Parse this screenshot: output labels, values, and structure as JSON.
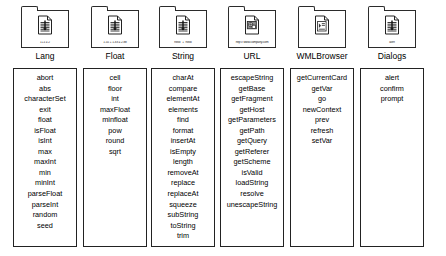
{
  "diagram": {
    "columns": [
      {
        "title": "Lang",
        "icon_name": "folder-icon",
        "glyph_name": "document-icon",
        "glyph_caption": "1+1 = 2",
        "methods": [
          "abort",
          "abs",
          "characterSet",
          "exit",
          "float",
          "isFloat",
          "isInt",
          "max",
          "maxInt",
          "min",
          "minInt",
          "parseFloat",
          "parseInt",
          "random",
          "seed"
        ]
      },
      {
        "title": "Float",
        "icon_name": "folder-icon",
        "glyph_name": "document-icon",
        "glyph_caption": "1.55 + 1.33 = 2.88",
        "methods": [
          "cell",
          "floor",
          "int",
          "maxFloat",
          "minfloat",
          "pow",
          "round",
          "sqrt"
        ]
      },
      {
        "title": "String",
        "icon_name": "folder-icon",
        "glyph_name": "document-icon",
        "glyph_caption": "\"hello\" + \"hello\"",
        "methods": [
          "charAt",
          "compare",
          "elementAt",
          "elements",
          "find",
          "format",
          "insertAt",
          "isEmpty",
          "length",
          "removeAt",
          "replace",
          "replaceAt",
          "squeeze",
          "subString",
          "toString",
          "trim"
        ]
      },
      {
        "title": "URL",
        "icon_name": "folder-icon",
        "glyph_name": "web-page-icon",
        "glyph_caption": "http:// www.company.com",
        "methods": [
          "escapeString",
          "getBase",
          "getFragment",
          "getHost",
          "getParameters",
          "getPath",
          "getQuery",
          "getReferer",
          "getScheme",
          "isValid",
          "loadString",
          "resolve",
          "unescapeString"
        ]
      },
      {
        "title": "WMLBrowser",
        "icon_name": "folder-icon",
        "glyph_name": "wml-card-icon",
        "glyph_caption": "",
        "methods": [
          "getCurrentCard",
          "getVar",
          "go",
          "newContext",
          "prev",
          "refresh",
          "setVar"
        ]
      },
      {
        "title": "Dialogs",
        "icon_name": "folder-icon",
        "glyph_name": "document-icon",
        "glyph_caption": "alert",
        "methods": [
          "alert",
          "confirm",
          "prompt"
        ]
      }
    ]
  },
  "colors": {
    "outline": "#222222",
    "shadow": "#9a9a9a",
    "background": "#ffffff",
    "text": "#000000"
  }
}
